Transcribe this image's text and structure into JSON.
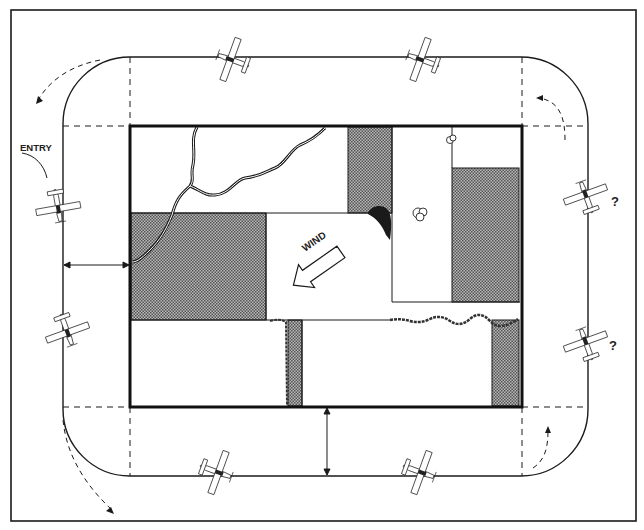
{
  "diagram": {
    "labels": {
      "entry": "ENTRY",
      "wind": "WIND",
      "question_upper": "?",
      "question_lower": "?"
    },
    "colors": {
      "line": "#1a1a1a",
      "shade": "#8a8a8a",
      "background": "#ffffff"
    },
    "airplanes": [
      {
        "id": "entry",
        "position": "left-upper",
        "heading": "south"
      },
      {
        "id": "left-lower",
        "position": "left-lower",
        "heading": "south"
      },
      {
        "id": "top-left",
        "position": "top-left",
        "heading": "west"
      },
      {
        "id": "top-right",
        "position": "top-right",
        "heading": "west"
      },
      {
        "id": "right-upper",
        "position": "right-upper",
        "heading": "north",
        "annotation": "?"
      },
      {
        "id": "right-lower",
        "position": "right-lower",
        "heading": "north",
        "annotation": "?"
      },
      {
        "id": "bottom-left",
        "position": "bottom-left",
        "heading": "east"
      },
      {
        "id": "bottom-right",
        "position": "bottom-right",
        "heading": "east"
      }
    ],
    "features": [
      "river",
      "hedgerows",
      "trees",
      "shaded fields",
      "distance arrows",
      "turn arrows"
    ]
  }
}
